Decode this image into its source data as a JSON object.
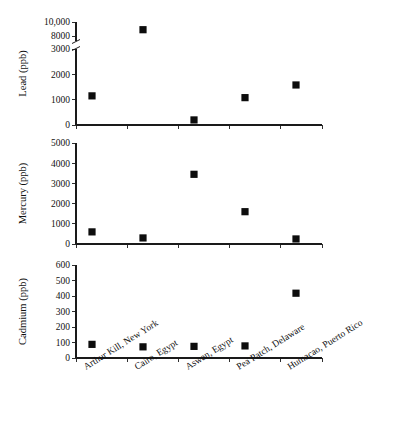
{
  "figure": {
    "title": "",
    "categories": [
      "Arthur Kill, New York",
      "Cairo, Egypt",
      "Aswan, Egypt",
      "Pea Patch, Delaware",
      "Humacao, Puerto Rico"
    ],
    "category_label_rotation_deg": -32,
    "marker_style": "filled-square",
    "error_bar_style": "capped-vertical",
    "colors": {
      "marker": "#0d0d0d",
      "axis": "#1a1a1a",
      "background": "#ffffff"
    }
  },
  "chart_data": [
    {
      "type": "scatter",
      "panel": "top",
      "title": "",
      "ylabel": "Lead (ppb)",
      "xlabel": "",
      "categories": [
        "Arthur Kill, New York",
        "Cairo, Egypt",
        "Aswan, Egypt",
        "Pea Patch, Delaware",
        "Humacao, Puerto Rico"
      ],
      "values": [
        1150,
        8900,
        200,
        1080,
        1580
      ],
      "err_low": [
        620,
        500,
        0,
        0,
        470
      ],
      "err_high": [
        670,
        500,
        0,
        0,
        430
      ],
      "broken_axis": true,
      "ylim_lower_segment": [
        0,
        3000
      ],
      "ylim_upper_segment": [
        8000,
        10000
      ],
      "yticks_lower": [
        0,
        1000,
        2000,
        3000
      ],
      "yticks_upper": [
        8000,
        10000
      ],
      "ytick_labels_lower": [
        "0",
        "1000",
        "2000",
        "3000"
      ],
      "ytick_labels_upper": [
        "8000",
        "10,000"
      ],
      "grid": false,
      "legend": "none"
    },
    {
      "type": "scatter",
      "panel": "middle",
      "title": "",
      "ylabel": "Mercury (ppb)",
      "xlabel": "",
      "categories": [
        "Arthur Kill, New York",
        "Cairo, Egypt",
        "Aswan, Egypt",
        "Pea Patch, Delaware",
        "Humacao, Puerto Rico"
      ],
      "values": [
        600,
        300,
        3450,
        1600,
        250
      ],
      "err_low": [
        170,
        0,
        870,
        400,
        0
      ],
      "err_high": [
        160,
        0,
        870,
        400,
        0
      ],
      "broken_axis": false,
      "ylim": [
        0,
        5000
      ],
      "yticks": [
        0,
        1000,
        2000,
        3000,
        4000,
        5000
      ],
      "ytick_labels": [
        "0",
        "1000",
        "2000",
        "3000",
        "4000",
        "5000"
      ],
      "grid": false,
      "legend": "none"
    },
    {
      "type": "scatter",
      "panel": "bottom",
      "title": "",
      "ylabel": "Cadmium (ppb)",
      "xlabel": "",
      "categories": [
        "Arthur Kill, New York",
        "Cairo, Egypt",
        "Aswan, Egypt",
        "Pea Patch, Delaware",
        "Humacao, Puerto Rico"
      ],
      "values": [
        88,
        72,
        75,
        78,
        418
      ],
      "err_low": [
        65,
        0,
        28,
        25,
        128
      ],
      "err_high": [
        62,
        0,
        27,
        24,
        128
      ],
      "broken_axis": false,
      "ylim": [
        0,
        600
      ],
      "yticks": [
        0,
        100,
        200,
        300,
        400,
        500,
        600
      ],
      "ytick_labels": [
        "0",
        "100",
        "200",
        "300",
        "400",
        "500",
        "600"
      ],
      "grid": false,
      "legend": "none"
    }
  ]
}
